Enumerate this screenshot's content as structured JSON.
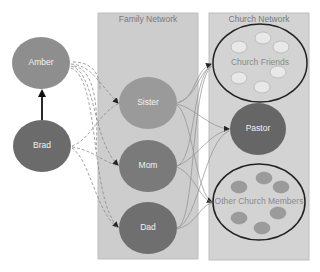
{
  "panels": {
    "family": {
      "title": "Family Network"
    },
    "church": {
      "title": "Church Network"
    }
  },
  "nodes": {
    "amber": {
      "label": "Amber"
    },
    "brad": {
      "label": "Brad"
    },
    "sister": {
      "label": "Sister"
    },
    "mom": {
      "label": "Mom"
    },
    "dad": {
      "label": "Dad"
    },
    "church_friends": {
      "label": "Church Friends"
    },
    "pastor": {
      "label": "Pastor"
    },
    "other_members": {
      "label": "Other Church Members"
    }
  },
  "colors": {
    "panel_fill": "#cdcdcd",
    "panel_stroke": "#bdbdbd",
    "amber_fill": "#8e8e8e",
    "brad_fill": "#6b6b6b",
    "sister_fill": "#9a9a9a",
    "mom_fill": "#7a7a7a",
    "dad_fill": "#6f6f6f",
    "pastor_fill": "#666666",
    "friend_dot_fill": "#e8e8e8",
    "member_dot_fill": "#9b9b9b",
    "edge_color": "#8a8a8a",
    "arrow_color": "#222222"
  },
  "edges": [
    {
      "from": "Brad",
      "to": "Amber",
      "style": "solid"
    },
    {
      "from": "Amber",
      "to": "Sister",
      "style": "dashed"
    },
    {
      "from": "Amber",
      "to": "Mom",
      "style": "dashed"
    },
    {
      "from": "Amber",
      "to": "Dad",
      "style": "dashed"
    },
    {
      "from": "Brad",
      "to": "Sister",
      "style": "dashed"
    },
    {
      "from": "Brad",
      "to": "Mom",
      "style": "dashed"
    },
    {
      "from": "Brad",
      "to": "Dad",
      "style": "dashed"
    },
    {
      "from": "Sister",
      "to": "Church Friends",
      "style": "solid"
    },
    {
      "from": "Sister",
      "to": "Pastor",
      "style": "solid"
    },
    {
      "from": "Sister",
      "to": "Other Church Members",
      "style": "solid"
    },
    {
      "from": "Mom",
      "to": "Church Friends",
      "style": "solid"
    },
    {
      "from": "Mom",
      "to": "Pastor",
      "style": "solid"
    },
    {
      "from": "Mom",
      "to": "Other Church Members",
      "style": "solid"
    },
    {
      "from": "Dad",
      "to": "Church Friends",
      "style": "solid"
    },
    {
      "from": "Dad",
      "to": "Pastor",
      "style": "solid"
    },
    {
      "from": "Dad",
      "to": "Other Church Members",
      "style": "solid"
    }
  ]
}
